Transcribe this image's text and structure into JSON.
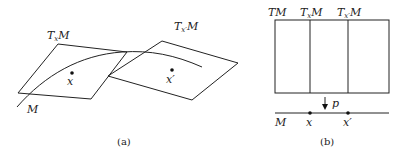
{
  "panel_a": {
    "caption": "(a)",
    "tangent_plane_x": {
      "T": "T",
      "sub": "x",
      "M": "M"
    },
    "tangent_plane_x_prime": {
      "T": "T",
      "sub": "x′",
      "M": "M"
    },
    "manifold_label": "M",
    "point_x": "x",
    "point_x_prime": "x′"
  },
  "panel_b": {
    "caption": "(b)",
    "bundle_label": "TM",
    "fiber_x": {
      "T": "T",
      "sub": "x",
      "M": "M"
    },
    "fiber_x_prime": {
      "T": "T",
      "sub": "x′",
      "M": "M"
    },
    "projection_label": "p",
    "base_label": "M",
    "point_x": "x",
    "point_x_prime": "x′"
  }
}
